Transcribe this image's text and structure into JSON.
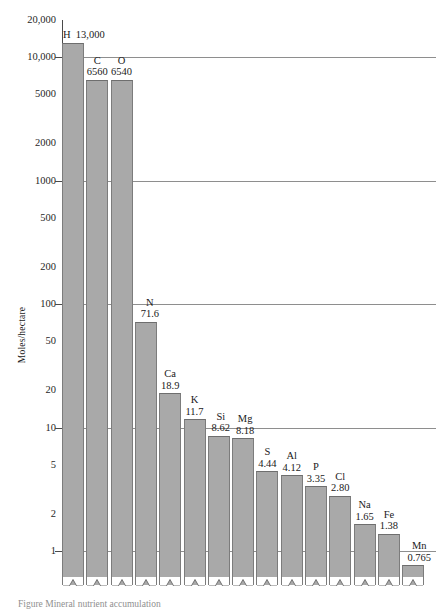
{
  "chart": {
    "type": "bar",
    "ylabel": "Moles/hectare",
    "caption": "Figure  Mineral nutrient accumulation"
  },
  "chart_data": {
    "type": "bar",
    "title": "",
    "xlabel": "",
    "ylabel": "Moles/hectare",
    "scale": "log",
    "ylim": [
      0.55,
      20000
    ],
    "grid": true,
    "legend": "none",
    "categories": [
      "H",
      "C",
      "O",
      "N",
      "Ca",
      "K",
      "Si",
      "Mg",
      "S",
      "Al",
      "P",
      "Cl",
      "Na",
      "Fe",
      "Mn"
    ],
    "values": [
      13000,
      6560,
      6540,
      71.6,
      18.9,
      11.7,
      8.62,
      8.18,
      4.44,
      4.12,
      3.35,
      2.8,
      1.65,
      1.38,
      0.765
    ],
    "value_labels": [
      "13,000",
      "6560",
      "6540",
      "71.6",
      "18.9",
      "11.7",
      "8.62",
      "8.18",
      "4.44",
      "4.12",
      "3.35",
      "2.80",
      "1.65",
      "1.38",
      "0.765"
    ],
    "ytick_labels": [
      "20,000",
      "10,000",
      "5000",
      "2000",
      "1000",
      "500",
      "200",
      "100",
      "50",
      "20",
      "10",
      "5",
      "2",
      "1"
    ],
    "ytick_values": [
      20000,
      10000,
      5000,
      2000,
      1000,
      500,
      200,
      100,
      50,
      20,
      10,
      5,
      2,
      1
    ],
    "gridline_values": [
      10000,
      1000,
      100,
      10,
      1
    ],
    "tickmark_values": [
      10000,
      1000,
      100,
      10,
      1
    ],
    "bar_color": "#a9a9a9",
    "gridline_color": "#8e8e8e",
    "axis_color": "#4a4a4a"
  }
}
